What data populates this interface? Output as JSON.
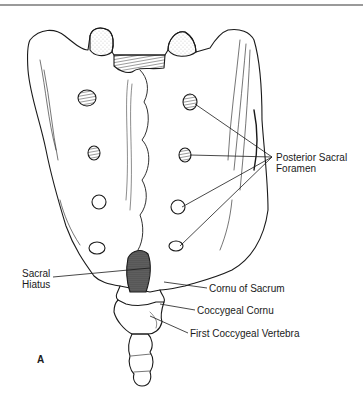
{
  "figure": {
    "panel_letter": "A",
    "labels": {
      "posterior_sacral_foramen": [
        "Posterior Sacral",
        "Foramen"
      ],
      "sacral_hiatus": [
        "Sacral",
        "Hiatus"
      ],
      "cornu_of_sacrum": "Cornu of Sacrum",
      "coccygeal_cornu": "Coccygeal Cornu",
      "first_coccygeal_vertebra": "First Coccygeal Vertebra"
    }
  }
}
